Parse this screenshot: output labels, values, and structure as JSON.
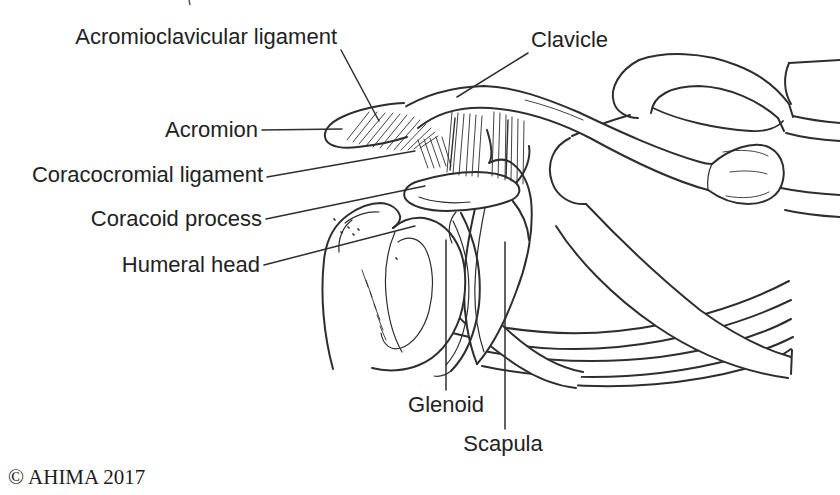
{
  "figure": {
    "illustration_name": "shoulder-acromioclavicular-joint-line-drawing",
    "background_color": "#ffffff",
    "ink_color": "#2e2e2e",
    "labels": {
      "acromioclavicular_ligament": "Acromioclavicular ligament",
      "clavicle": "Clavicle",
      "acromion": "Acromion",
      "coracocromial_ligament": "Coracocromial ligament",
      "coracoid_process": "Coracoid process",
      "humeral_head": "Humeral head",
      "glenoid": "Glenoid",
      "scapula": "Scapula"
    },
    "copyright_notice": "© AHIMA 2017"
  }
}
